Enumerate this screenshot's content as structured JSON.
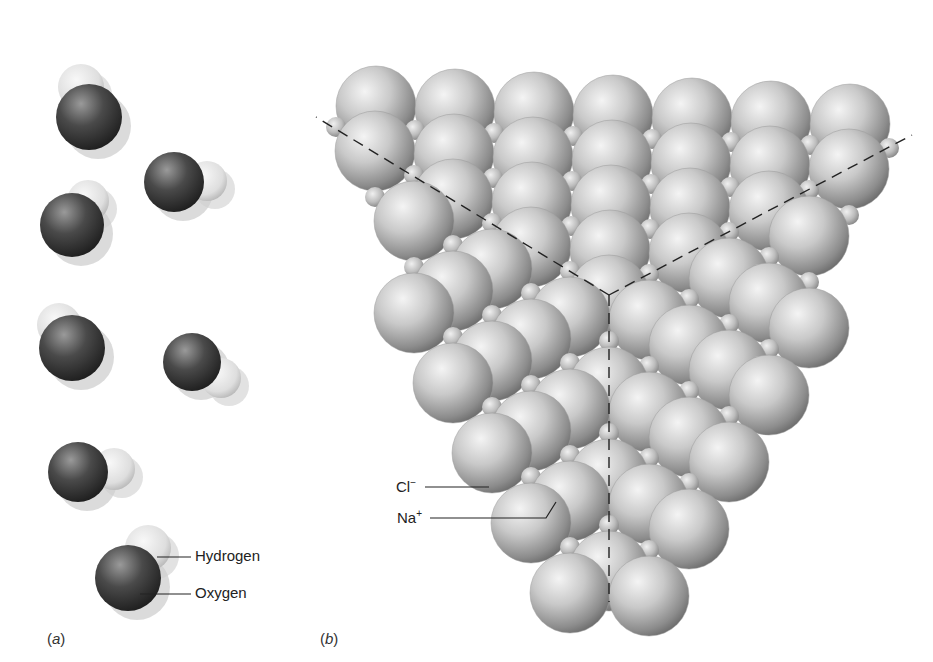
{
  "figure": {
    "panel_a_label": "(a)",
    "panel_b_label": "(b)",
    "panel_a_caption_letter": "a",
    "panel_b_caption_letter": "b"
  },
  "panel_a": {
    "title": "Water molecules",
    "labels": {
      "hydrogen": "Hydrogen",
      "oxygen": "Oxygen"
    },
    "molecules": [
      {
        "ox": 89,
        "oy": 117,
        "hx": 81,
        "hy": 87,
        "r": 33,
        "hr": 23
      },
      {
        "ox": 174,
        "oy": 182,
        "hx": 207,
        "hy": 181,
        "r": 30,
        "hr": 20
      },
      {
        "ox": 72,
        "oy": 225,
        "hx": 88,
        "hy": 201,
        "r": 32,
        "hr": 21
      },
      {
        "ox": 72,
        "oy": 348,
        "hx": 59,
        "hy": 325,
        "r": 33,
        "hr": 22
      },
      {
        "ox": 192,
        "oy": 362,
        "hx": 221,
        "hy": 378,
        "r": 29,
        "hr": 20
      },
      {
        "ox": 78,
        "oy": 472,
        "hx": 114,
        "hy": 469,
        "r": 30,
        "hr": 21
      },
      {
        "ox": 128,
        "oy": 578,
        "hx": 148,
        "hy": 548,
        "r": 33,
        "hr": 23
      }
    ],
    "colors": {
      "oxygen": "#3a3a3a",
      "hydrogen": "#e4e4e4",
      "shadow": "#cfcfcf"
    }
  },
  "panel_b": {
    "title": "Sodium chloride crystal",
    "labels": {
      "chloride": "Cl",
      "chloride_charge": "−",
      "sodium": "Na",
      "sodium_charge": "+"
    },
    "vertex": {
      "x": 609,
      "y": 295
    },
    "axes": [
      {
        "x1": 609,
        "y1": 295,
        "x2": 316,
        "y2": 117
      },
      {
        "x1": 609,
        "y1": 295,
        "x2": 912,
        "y2": 135
      },
      {
        "x1": 609,
        "y1": 295,
        "x2": 609,
        "y2": 602
      }
    ],
    "cl_radius": 40,
    "na_radius": 10,
    "colors": {
      "sphere_light": "#f2f2f2",
      "sphere_mid": "#bdbdbd",
      "sphere_dark": "#777777",
      "axis": "#222222"
    }
  }
}
